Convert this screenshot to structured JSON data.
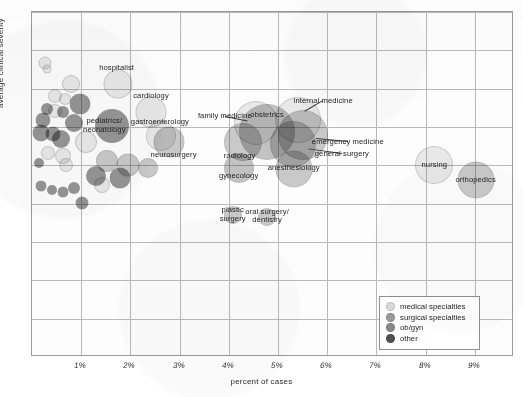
{
  "chart_data": {
    "type": "scatter",
    "title": "",
    "xlabel": "percent of cases",
    "ylabel": "average clinical severity",
    "xlim": [
      0,
      9.8
    ],
    "ylim": [
      0,
      9
    ],
    "xticks": [
      "1%",
      "2%",
      "3%",
      "4%",
      "5%",
      "6%",
      "7%",
      "8%",
      "9%"
    ],
    "xtick_values": [
      1,
      2,
      3,
      4,
      5,
      6,
      7,
      8,
      9
    ],
    "yticks": [
      "0",
      "1",
      "2",
      "3",
      "4",
      "5",
      "6",
      "7",
      "8",
      "9"
    ],
    "ytick_values": [
      0,
      1,
      2,
      3,
      4,
      5,
      6,
      7,
      8,
      9
    ],
    "grid": true,
    "legend_position": "bottom-right",
    "size_encoding": "bubble area = relative volume of cases",
    "categories": [
      {
        "key": "medical",
        "label": "medical specialties",
        "color": "#d8d8d8"
      },
      {
        "key": "surgical",
        "label": "surgical specialties",
        "color": "#9a9a9a"
      },
      {
        "key": "obgyn",
        "label": "ob/gyn",
        "color": "#8a8a8a"
      },
      {
        "key": "other",
        "label": "other",
        "color": "#555555"
      }
    ],
    "points": [
      {
        "label": "hospitalist",
        "x": 1.75,
        "y": 7.12,
        "r": 13.5,
        "cat": "medical",
        "lx": 1.72,
        "ly": 7.55,
        "leader": false
      },
      {
        "label": "cardiology",
        "x": 2.42,
        "y": 6.38,
        "r": 14.5,
        "cat": "medical",
        "lx": 2.42,
        "ly": 6.82,
        "leader": false
      },
      {
        "label": "pediatrics/\nneonatology",
        "x": 1.62,
        "y": 6.02,
        "r": 16.0,
        "cat": "other",
        "lx": 1.47,
        "ly": 6.02,
        "leader": false
      },
      {
        "label": "gastroenterology",
        "x": 2.62,
        "y": 5.76,
        "r": 14.0,
        "cat": "medical",
        "lx": 2.6,
        "ly": 6.12,
        "leader": false
      },
      {
        "label": "neurosurgery",
        "x": 2.78,
        "y": 5.62,
        "r": 14.5,
        "cat": "surgical",
        "lx": 2.88,
        "ly": 5.27,
        "leader": false
      },
      {
        "label": "family medicine",
        "x": 4.55,
        "y": 6.1,
        "r": 21.0,
        "cat": "medical",
        "lx": 3.92,
        "ly": 6.3,
        "leader": true,
        "tx": 4.38,
        "ty": 6.18
      },
      {
        "label": "obstetrics",
        "x": 4.78,
        "y": 5.88,
        "r": 27.0,
        "cat": "obgyn",
        "lx": 4.78,
        "ly": 6.32,
        "leader": false
      },
      {
        "label": "internal medicine",
        "x": 5.4,
        "y": 6.18,
        "r": 22.0,
        "cat": "medical",
        "lx": 5.92,
        "ly": 6.68,
        "leader": true,
        "tx": 5.55,
        "ty": 6.4
      },
      {
        "label": "emergency medicine",
        "x": 5.5,
        "y": 5.78,
        "r": 24.0,
        "cat": "surgical",
        "lx": 6.42,
        "ly": 5.62,
        "leader": true,
        "tx": 5.78,
        "ty": 5.7
      },
      {
        "label": "general surgery",
        "x": 5.3,
        "y": 5.55,
        "r": 22.0,
        "cat": "surgical",
        "lx": 6.3,
        "ly": 5.3,
        "leader": true,
        "tx": 5.62,
        "ty": 5.42
      },
      {
        "label": "radiology",
        "x": 4.28,
        "y": 5.6,
        "r": 18.0,
        "cat": "surgical",
        "lx": 4.22,
        "ly": 5.25,
        "leader": false
      },
      {
        "label": "gynecology",
        "x": 4.2,
        "y": 4.92,
        "r": 14.0,
        "cat": "obgyn",
        "lx": 4.2,
        "ly": 4.72,
        "leader": false
      },
      {
        "label": "anesthesiology",
        "x": 5.32,
        "y": 4.9,
        "r": 17.5,
        "cat": "surgical",
        "lx": 5.32,
        "ly": 4.92,
        "leader": false
      },
      {
        "label": "nursing",
        "x": 8.18,
        "y": 5.02,
        "r": 18.0,
        "cat": "medical",
        "lx": 8.18,
        "ly": 5.02,
        "leader": false
      },
      {
        "label": "orthopedics",
        "x": 9.02,
        "y": 4.62,
        "r": 17.5,
        "cat": "surgical",
        "lx": 9.02,
        "ly": 4.62,
        "leader": false
      },
      {
        "label": "plastic\nsurgery",
        "x": 4.08,
        "y": 3.7,
        "r": 8.0,
        "cat": "surgical",
        "lx": 4.08,
        "ly": 3.7,
        "leader": false
      },
      {
        "label": "oral surgery/\ndentistry",
        "x": 4.78,
        "y": 3.66,
        "r": 8.0,
        "cat": "surgical",
        "lx": 4.78,
        "ly": 3.66,
        "leader": false
      }
    ],
    "unlabeled_points": [
      {
        "x": 0.27,
        "y": 7.68,
        "r": 5.5,
        "cat": "medical"
      },
      {
        "x": 0.3,
        "y": 7.52,
        "r": 3.5,
        "cat": "medical"
      },
      {
        "x": 0.8,
        "y": 7.13,
        "r": 8.0,
        "cat": "medical"
      },
      {
        "x": 0.46,
        "y": 6.8,
        "r": 6.0,
        "cat": "medical"
      },
      {
        "x": 0.66,
        "y": 6.72,
        "r": 5.0,
        "cat": "medical"
      },
      {
        "x": 0.98,
        "y": 6.6,
        "r": 9.5,
        "cat": "other"
      },
      {
        "x": 0.3,
        "y": 6.46,
        "r": 5.0,
        "cat": "other"
      },
      {
        "x": 0.46,
        "y": 6.42,
        "r": 6.0,
        "cat": "medical"
      },
      {
        "x": 0.62,
        "y": 6.38,
        "r": 5.0,
        "cat": "other"
      },
      {
        "x": 0.22,
        "y": 6.18,
        "r": 6.5,
        "cat": "other"
      },
      {
        "x": 0.86,
        "y": 6.1,
        "r": 8.0,
        "cat": "other"
      },
      {
        "x": 0.18,
        "y": 5.85,
        "r": 7.5,
        "cat": "other"
      },
      {
        "x": 0.42,
        "y": 5.82,
        "r": 6.5,
        "cat": "other"
      },
      {
        "x": 0.58,
        "y": 5.7,
        "r": 8.0,
        "cat": "other"
      },
      {
        "x": 1.1,
        "y": 5.6,
        "r": 10.0,
        "cat": "medical"
      },
      {
        "x": 0.32,
        "y": 5.32,
        "r": 6.0,
        "cat": "medical"
      },
      {
        "x": 0.62,
        "y": 5.25,
        "r": 7.0,
        "cat": "medical"
      },
      {
        "x": 0.14,
        "y": 5.06,
        "r": 4.0,
        "cat": "other"
      },
      {
        "x": 0.7,
        "y": 5.02,
        "r": 6.0,
        "cat": "medical"
      },
      {
        "x": 1.52,
        "y": 5.12,
        "r": 10.0,
        "cat": "surgical"
      },
      {
        "x": 1.95,
        "y": 5.0,
        "r": 10.5,
        "cat": "surgical"
      },
      {
        "x": 2.35,
        "y": 4.92,
        "r": 9.0,
        "cat": "surgical"
      },
      {
        "x": 1.3,
        "y": 4.72,
        "r": 9.0,
        "cat": "other"
      },
      {
        "x": 1.78,
        "y": 4.66,
        "r": 9.5,
        "cat": "other"
      },
      {
        "x": 1.42,
        "y": 4.48,
        "r": 7.0,
        "cat": "medical"
      },
      {
        "x": 0.18,
        "y": 4.46,
        "r": 4.5,
        "cat": "other"
      },
      {
        "x": 0.4,
        "y": 4.36,
        "r": 4.0,
        "cat": "other"
      },
      {
        "x": 0.62,
        "y": 4.3,
        "r": 4.5,
        "cat": "other"
      },
      {
        "x": 0.86,
        "y": 4.42,
        "r": 5.0,
        "cat": "other"
      },
      {
        "x": 1.02,
        "y": 4.02,
        "r": 5.5,
        "cat": "other"
      }
    ]
  },
  "legend": {
    "items": [
      {
        "label": "medical specialties",
        "color": "#d8d8d8"
      },
      {
        "label": "surgical specialties",
        "color": "#9a9a9a"
      },
      {
        "label": "ob/gyn",
        "color": "#888888"
      },
      {
        "label": "other",
        "color": "#4f4f4f"
      }
    ]
  }
}
